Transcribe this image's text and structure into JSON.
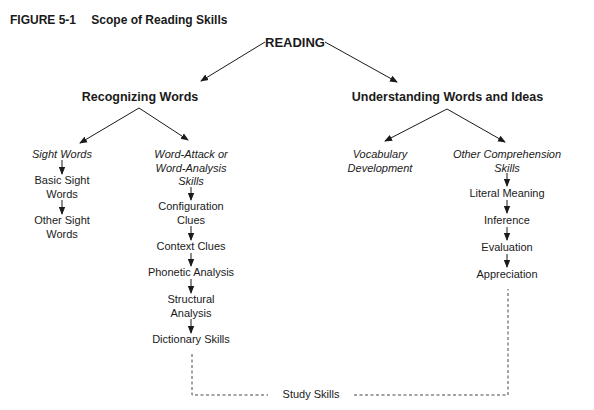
{
  "figure": {
    "label": "FIGURE 5-1",
    "title": "Scope of Reading Skills"
  },
  "root": "READING",
  "branches": {
    "recognizing": {
      "label": "Recognizing Words",
      "sight": {
        "label_lines": [
          "Sight Words"
        ],
        "steps": [
          [
            "Basic Sight",
            "Words"
          ],
          [
            "Other Sight",
            "Words"
          ]
        ]
      },
      "word_attack": {
        "label_lines": [
          "Word-Attack or",
          "Word-Analysis",
          "Skills"
        ],
        "steps": [
          [
            "Configuration",
            "Clues"
          ],
          [
            "Context Clues"
          ],
          [
            "Phonetic Analysis"
          ],
          [
            "Structural",
            "Analysis"
          ],
          [
            "Dictionary Skills"
          ]
        ]
      }
    },
    "understanding": {
      "label": "Understanding Words and Ideas",
      "vocabulary": {
        "label_lines": [
          "Vocabulary",
          "Development"
        ]
      },
      "comprehension": {
        "label_lines": [
          "Other Comprehension",
          "Skills"
        ],
        "steps": [
          [
            "Literal Meaning"
          ],
          [
            "Inference"
          ],
          [
            "Evaluation"
          ],
          [
            "Appreciation"
          ]
        ]
      }
    }
  },
  "connector": {
    "label": "Study Skills"
  }
}
